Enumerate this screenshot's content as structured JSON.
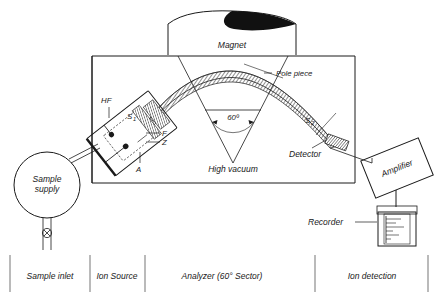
{
  "diagram": {
    "labels": {
      "sample_supply": "Sample\nsupply",
      "sample_supply_line1": "Sample",
      "sample_supply_line2": "supply",
      "hf": "HF",
      "slit1": "S",
      "slit1_sub": "1",
      "f": "F",
      "z": "Z",
      "a": "A",
      "magnet": "Magnet",
      "pole_piece": "Pole piece",
      "angle": "60º",
      "high_vacuum": "High vacuum",
      "slit2": "S",
      "slit2_sub": "2",
      "detector": "Detector",
      "amplifier": "Amplifier",
      "recorder": "Recorder"
    },
    "sections": [
      {
        "label": "Sample  inlet"
      },
      {
        "label": "Ion Source"
      },
      {
        "label": "Analyzer (60° Sector)"
      },
      {
        "label": "Ion detection"
      }
    ],
    "colors": {
      "ink": "#1a1a1a",
      "paper": "#ffffff",
      "beam_fill": "#8a8a8a",
      "magnet_pole": "#111111"
    }
  }
}
